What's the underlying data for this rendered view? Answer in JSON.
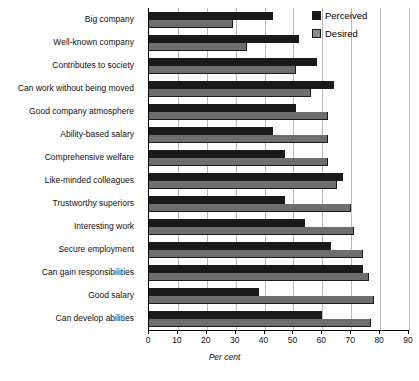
{
  "chart_data": {
    "type": "bar",
    "orientation": "horizontal",
    "title": "",
    "xlabel": "Per cent",
    "ylabel": "",
    "xlim": [
      0,
      90
    ],
    "xticks": [
      0,
      10,
      20,
      30,
      40,
      50,
      60,
      70,
      80,
      90
    ],
    "grid": true,
    "legend_position": "top-right",
    "categories": [
      "Big company",
      "Well-known company",
      "Contributes to society",
      "Can work without being moved",
      "Good company atmosphere",
      "Ability-based salary",
      "Comprehensive welfare",
      "Like-minded colleagues",
      "Trustworthy superiors",
      "Interesting work",
      "Secure employment",
      "Can gain responsibilities",
      "Good salary",
      "Can develop abilities"
    ],
    "series": [
      {
        "name": "Perceived",
        "color": "#1a1a1a",
        "values": [
          43,
          52,
          58,
          64,
          51,
          43,
          47,
          67,
          47,
          54,
          63,
          74,
          38,
          60
        ]
      },
      {
        "name": "Desired",
        "color": "#6e6e6e",
        "values": [
          29,
          34,
          51,
          56,
          62,
          62,
          62,
          65,
          70,
          71,
          74,
          76,
          78,
          77
        ]
      }
    ]
  },
  "legend": {
    "items": [
      {
        "label": "Perceived",
        "swatch": "perceived"
      },
      {
        "label": "Desired",
        "swatch": "desired"
      }
    ]
  }
}
